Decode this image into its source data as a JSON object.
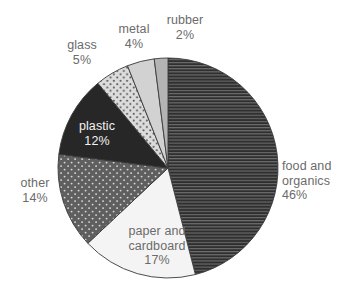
{
  "chart_data": {
    "type": "pie",
    "title": "",
    "subtitle": "",
    "xlabel": "",
    "ylabel": "",
    "legend_position": "none",
    "grid": false,
    "units": "percent",
    "start_angle_deg": 0,
    "direction": "clockwise",
    "categories": [
      "food and organics",
      "paper and cardboard",
      "other",
      "plastic",
      "glass",
      "metal",
      "rubber"
    ],
    "values": [
      46,
      17,
      14,
      12,
      5,
      4,
      2
    ],
    "slices": [
      {
        "name": "food-and-organics",
        "label_line1": "food and",
        "label_line2": "organics",
        "value_text": "46%",
        "value": 46,
        "fill": "#2f2f2f",
        "pattern": "horizontal-lines",
        "pattern_color": "#6e6e6e",
        "label_color": "#6b6b6b",
        "label_placement": "outside-right"
      },
      {
        "name": "paper-and-cardboard",
        "label_line1": "paper and",
        "label_line2": "cardboard",
        "value_text": "17%",
        "value": 17,
        "fill": "#f4f4f4",
        "pattern": "solid",
        "pattern_color": "",
        "label_color": "#6b6b6b",
        "label_placement": "inside"
      },
      {
        "name": "other",
        "label_line1": "other",
        "label_line2": "",
        "value_text": "14%",
        "value": 14,
        "fill": "#5f5f5f",
        "pattern": "white-dots",
        "pattern_color": "#d8d8d8",
        "label_color": "#6b6b6b",
        "label_placement": "outside-left"
      },
      {
        "name": "plastic",
        "label_line1": "plastic",
        "label_line2": "",
        "value_text": "12%",
        "value": 12,
        "fill": "#272727",
        "pattern": "solid",
        "pattern_color": "",
        "label_color": "#f2f2f2",
        "label_placement": "inside"
      },
      {
        "name": "glass",
        "label_line1": "glass",
        "label_line2": "",
        "value_text": "5%",
        "value": 5,
        "fill": "#dcdcdc",
        "pattern": "dark-dots",
        "pattern_color": "#4a4a4a",
        "label_color": "#6b6b6b",
        "label_placement": "outside-top-left"
      },
      {
        "name": "metal",
        "label_line1": "metal",
        "label_line2": "",
        "value_text": "4%",
        "value": 4,
        "fill": "#d2d2d2",
        "pattern": "solid",
        "pattern_color": "",
        "label_color": "#6b6b6b",
        "label_placement": "outside-top"
      },
      {
        "name": "rubber",
        "label_line1": "rubber",
        "label_line2": "",
        "value_text": "2%",
        "value": 2,
        "fill": "#b4b4b4",
        "pattern": "solid",
        "pattern_color": "",
        "label_color": "#6b6b6b",
        "label_placement": "outside-top-right"
      }
    ],
    "colors": {
      "background": "#ffffff",
      "outline": "#3a3a3a",
      "text": "#6b6b6b",
      "text_on_dark": "#f2f2f2"
    }
  }
}
